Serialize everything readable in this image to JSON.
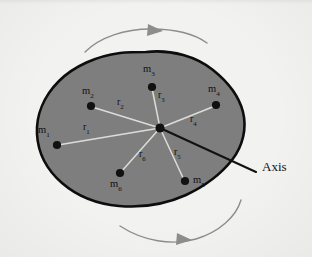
{
  "figure": {
    "caption_axis": "Axis",
    "background_color": "#f2f2f1",
    "body_fill_color": "#7e7e7e",
    "body_outline_color": "#0d0d0d",
    "radius_line_color": "#d8d8d4",
    "axis_line_color": "#121212",
    "arrow_color": "#8d8d8d",
    "point_color": "#111111"
  },
  "center": {
    "name": "rotation-center",
    "x": 160,
    "y": 128
  },
  "masses": [
    {
      "label": "m",
      "index": "1",
      "dot_x": 57,
      "dot_y": 145,
      "label_x": 38,
      "label_y": 127
    },
    {
      "label": "m",
      "index": "2",
      "dot_x": 91,
      "dot_y": 106,
      "label_x": 82,
      "label_y": 88
    },
    {
      "label": "m",
      "index": "3",
      "dot_x": 152,
      "dot_y": 87,
      "label_x": 143,
      "label_y": 66
    },
    {
      "label": "m",
      "index": "4",
      "dot_x": 216,
      "dot_y": 105,
      "label_x": 208,
      "label_y": 86
    },
    {
      "label": "m",
      "index": "5",
      "dot_x": 185,
      "dot_y": 181,
      "label_x": 194,
      "label_y": 176
    },
    {
      "label": "m",
      "index": "6",
      "dot_x": 120,
      "dot_y": 173,
      "label_x": 111,
      "label_y": 180
    }
  ],
  "radii": [
    {
      "label": "r",
      "index": "1",
      "label_x": 85,
      "label_y": 126
    },
    {
      "label": "r",
      "index": "2",
      "label_x": 118,
      "label_y": 100
    },
    {
      "label": "r",
      "index": "3",
      "label_x": 159,
      "label_y": 94
    },
    {
      "label": "r",
      "index": "4",
      "label_x": 191,
      "label_y": 118
    },
    {
      "label": "r",
      "index": "5",
      "label_x": 175,
      "label_y": 150
    },
    {
      "label": "r",
      "index": "6",
      "label_x": 140,
      "label_y": 152
    }
  ],
  "axis": {
    "name": "rotation-axis",
    "label": "Axis",
    "line_start_x": 160,
    "line_start_y": 128,
    "line_end_x": 256,
    "line_end_y": 172,
    "label_x": 264,
    "label_y": 165
  },
  "rotation_arrows": [
    {
      "name": "top-rotation-arrow",
      "direction": "clockwise-right"
    },
    {
      "name": "bottom-rotation-arrow",
      "direction": "clockwise-left"
    }
  ]
}
